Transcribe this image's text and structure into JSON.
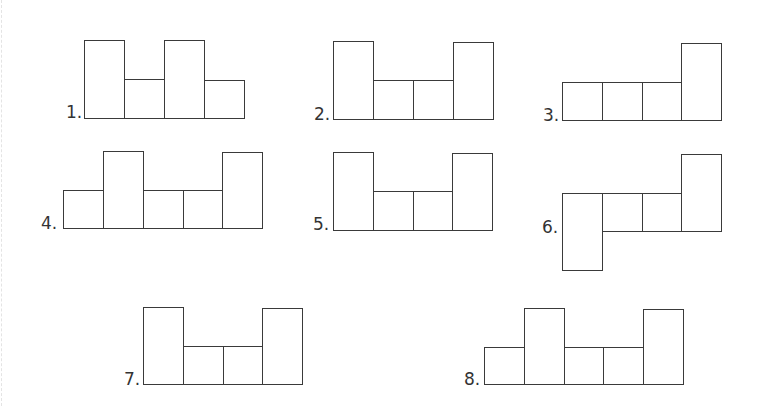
{
  "page": {
    "stroke_color": "#3a3a3a",
    "background": "#ffffff"
  },
  "figures": [
    {
      "label": "1.",
      "label_pos": [
        66,
        104
      ],
      "cells": [
        {
          "x": 84,
          "y": 40,
          "w": 40,
          "h": 78
        },
        {
          "x": 124,
          "y": 79,
          "w": 40,
          "h": 39
        },
        {
          "x": 164,
          "y": 40,
          "w": 40,
          "h": 78
        },
        {
          "x": 204,
          "y": 80,
          "w": 40,
          "h": 38
        }
      ]
    },
    {
      "label": "2.",
      "label_pos": [
        314,
        106
      ],
      "cells": [
        {
          "x": 333,
          "y": 41,
          "w": 40,
          "h": 78
        },
        {
          "x": 373,
          "y": 80,
          "w": 40,
          "h": 39
        },
        {
          "x": 413,
          "y": 80,
          "w": 40,
          "h": 39
        },
        {
          "x": 453,
          "y": 42,
          "w": 40,
          "h": 77
        }
      ]
    },
    {
      "label": "3.",
      "label_pos": [
        543,
        107
      ],
      "cells": [
        {
          "x": 562,
          "y": 82,
          "w": 40,
          "h": 38
        },
        {
          "x": 602,
          "y": 82,
          "w": 40,
          "h": 38
        },
        {
          "x": 642,
          "y": 82,
          "w": 40,
          "h": 38
        },
        {
          "x": 681,
          "y": 43,
          "w": 40,
          "h": 77
        }
      ]
    },
    {
      "label": "4.",
      "label_pos": [
        41,
        215
      ],
      "cells": [
        {
          "x": 63,
          "y": 190,
          "w": 40,
          "h": 38
        },
        {
          "x": 103,
          "y": 151,
          "w": 40,
          "h": 77
        },
        {
          "x": 143,
          "y": 190,
          "w": 40,
          "h": 38
        },
        {
          "x": 183,
          "y": 190,
          "w": 40,
          "h": 38
        },
        {
          "x": 222,
          "y": 152,
          "w": 40,
          "h": 76
        }
      ]
    },
    {
      "label": "5.",
      "label_pos": [
        313,
        216
      ],
      "cells": [
        {
          "x": 333,
          "y": 152,
          "w": 40,
          "h": 78
        },
        {
          "x": 373,
          "y": 191,
          "w": 40,
          "h": 39
        },
        {
          "x": 413,
          "y": 191,
          "w": 40,
          "h": 39
        },
        {
          "x": 452,
          "y": 153,
          "w": 40,
          "h": 77
        }
      ]
    },
    {
      "label": "6.",
      "label_pos": [
        542,
        219
      ],
      "cells": [
        {
          "x": 562,
          "y": 193,
          "w": 40,
          "h": 77
        },
        {
          "x": 602,
          "y": 193,
          "w": 40,
          "h": 38
        },
        {
          "x": 642,
          "y": 193,
          "w": 40,
          "h": 38
        },
        {
          "x": 681,
          "y": 154,
          "w": 40,
          "h": 77
        }
      ]
    },
    {
      "label": "7.",
      "label_pos": [
        124,
        371
      ],
      "cells": [
        {
          "x": 143,
          "y": 307,
          "w": 40,
          "h": 77
        },
        {
          "x": 183,
          "y": 346,
          "w": 40,
          "h": 38
        },
        {
          "x": 223,
          "y": 346,
          "w": 40,
          "h": 38
        },
        {
          "x": 262,
          "y": 308,
          "w": 40,
          "h": 76
        }
      ]
    },
    {
      "label": "8.",
      "label_pos": [
        464,
        371
      ],
      "cells": [
        {
          "x": 484,
          "y": 347,
          "w": 40,
          "h": 37
        },
        {
          "x": 524,
          "y": 308,
          "w": 40,
          "h": 76
        },
        {
          "x": 564,
          "y": 347,
          "w": 40,
          "h": 37
        },
        {
          "x": 603,
          "y": 347,
          "w": 40,
          "h": 37
        },
        {
          "x": 643,
          "y": 309,
          "w": 40,
          "h": 75
        }
      ]
    }
  ]
}
